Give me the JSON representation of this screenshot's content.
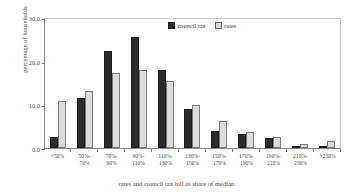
{
  "chart_data": {
    "type": "bar",
    "title": "",
    "xlabel": "rates and council tax bill as share of median",
    "ylabel": "percentage of households",
    "ylim": [
      0,
      30
    ],
    "yticks": [
      "0.0",
      "10.0",
      "20.0",
      "30.0"
    ],
    "grid": false,
    "legend_position": "top-center",
    "categories": [
      "<50%",
      "50%-70%",
      "70%-90%",
      "90%-110%",
      "110%-130%",
      "130%-150%",
      "150%-170%",
      "170%-190%",
      "190%-210%",
      "210%-230%",
      ">230%"
    ],
    "category_lines": [
      [
        "<50%",
        ""
      ],
      [
        "50%-",
        "70%"
      ],
      [
        "70%-",
        "90%"
      ],
      [
        "90%-",
        "110%"
      ],
      [
        "110%-",
        "130%"
      ],
      [
        "130%-",
        "150%"
      ],
      [
        "150%-",
        "170%"
      ],
      [
        "170%-",
        "190%"
      ],
      [
        "190%-",
        "210%"
      ],
      [
        "210%-",
        "230%"
      ],
      [
        ">230%",
        ""
      ]
    ],
    "series": [
      {
        "name": "council tax",
        "color": "#2b2b2b",
        "values": [
          2.5,
          11.5,
          22.2,
          25.4,
          17.8,
          8.9,
          4.0,
          3.3,
          2.4,
          0.5,
          0.4
        ]
      },
      {
        "name": "rates",
        "color": "#dcdcdc",
        "values": [
          10.8,
          13.0,
          17.2,
          17.8,
          15.3,
          9.9,
          6.1,
          3.6,
          2.5,
          1.0,
          1.7
        ]
      }
    ]
  }
}
